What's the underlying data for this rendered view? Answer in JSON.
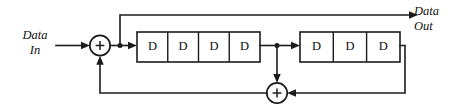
{
  "diagram": {
    "type": "block-diagram",
    "colors": {
      "line": "#1c1c1c",
      "fill": "#ffffff",
      "text": "#101010",
      "background": "#ffffff"
    },
    "io": {
      "input": {
        "line1": "Data",
        "line2": "In"
      },
      "output": {
        "line1": "Data",
        "line2": "Out"
      }
    },
    "adders": [
      {
        "id": "input-adder",
        "symbol": "+",
        "cx": 100,
        "cy": 45,
        "r": 10
      },
      {
        "id": "feedback-adder",
        "symbol": "+",
        "cx": 277,
        "cy": 93,
        "r": 10
      }
    ],
    "registers": [
      {
        "id": "register-block-1",
        "cell_count": 4,
        "cells": [
          {
            "label": "D"
          },
          {
            "label": "D"
          },
          {
            "label": "D"
          },
          {
            "label": "D"
          }
        ]
      },
      {
        "id": "register-block-2",
        "cell_count": 3,
        "cells": [
          {
            "label": "D"
          },
          {
            "label": "D"
          },
          {
            "label": "D"
          }
        ]
      }
    ],
    "nets": [
      {
        "id": "input-wire",
        "from": "Data In",
        "to": "input-adder"
      },
      {
        "id": "adder-to-branch",
        "from": "input-adder",
        "to": "output-tap"
      },
      {
        "id": "output-tap-up",
        "from": "output-tap",
        "to": "Data Out"
      },
      {
        "id": "branch-to-reg1",
        "from": "output-tap",
        "to": "register-block-1"
      },
      {
        "id": "reg1-to-tap2",
        "from": "register-block-1",
        "to": "mid-tap"
      },
      {
        "id": "mid-tap-to-reg2",
        "from": "mid-tap",
        "to": "register-block-2"
      },
      {
        "id": "mid-tap-down",
        "from": "mid-tap",
        "to": "feedback-adder"
      },
      {
        "id": "reg2-to-feedback",
        "from": "register-block-2",
        "to": "feedback-adder"
      },
      {
        "id": "feedback-to-input-adder",
        "from": "feedback-adder",
        "to": "input-adder"
      }
    ]
  }
}
